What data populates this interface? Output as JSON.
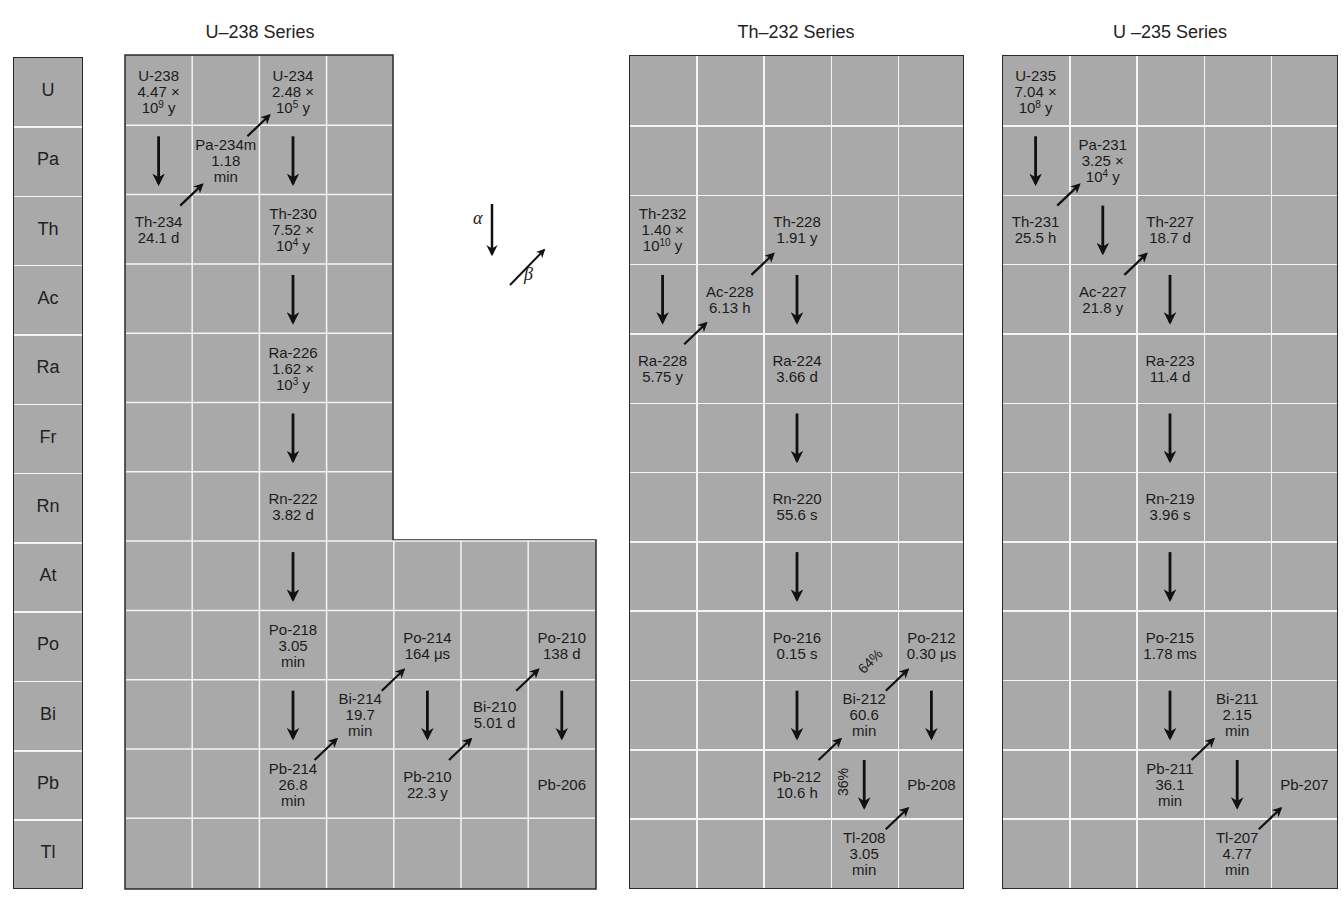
{
  "elements": [
    "U",
    "Pa",
    "Th",
    "Ac",
    "Ra",
    "Fr",
    "Rn",
    "At",
    "Po",
    "Bi",
    "Pb",
    "Tl"
  ],
  "legend": {
    "alpha_label": "α",
    "beta_label": "β"
  },
  "series": [
    {
      "id": "u238",
      "title": "U–238 Series",
      "nuclides": [
        {
          "name": "U-238",
          "halflife": [
            "4.47 ×",
            "10^9 y"
          ],
          "row": 0,
          "col": 0
        },
        {
          "name": "Pa-234m",
          "halflife": [
            "1.18",
            "min"
          ],
          "row": 1,
          "col": 1
        },
        {
          "name": "U-234",
          "halflife": [
            "2.48 ×",
            "10^5 y"
          ],
          "row": 0,
          "col": 2
        },
        {
          "name": "Th-234",
          "halflife": [
            "24.1 d"
          ],
          "row": 2,
          "col": 0
        },
        {
          "name": "Th-230",
          "halflife": [
            "7.52 ×",
            "10^4 y"
          ],
          "row": 2,
          "col": 2
        },
        {
          "name": "Ra-226",
          "halflife": [
            "1.62 ×",
            "10^3 y"
          ],
          "row": 4,
          "col": 2
        },
        {
          "name": "Rn-222",
          "halflife": [
            "3.82 d"
          ],
          "row": 6,
          "col": 2
        },
        {
          "name": "Po-218",
          "halflife": [
            "3.05",
            "min"
          ],
          "row": 8,
          "col": 2
        },
        {
          "name": "Pb-214",
          "halflife": [
            "26.8",
            "min"
          ],
          "row": 10,
          "col": 2
        },
        {
          "name": "Bi-214",
          "halflife": [
            "19.7",
            "min"
          ],
          "row": 9,
          "col": 3
        },
        {
          "name": "Po-214",
          "halflife": [
            "164 μs"
          ],
          "row": 8,
          "col": 4
        },
        {
          "name": "Pb-210",
          "halflife": [
            "22.3 y"
          ],
          "row": 10,
          "col": 4
        },
        {
          "name": "Bi-210",
          "halflife": [
            "5.01 d"
          ],
          "row": 9,
          "col": 5
        },
        {
          "name": "Po-210",
          "halflife": [
            "138 d"
          ],
          "row": 8,
          "col": 6
        },
        {
          "name": "Pb-206",
          "halflife": [],
          "row": 10,
          "col": 6
        }
      ],
      "decays": [
        {
          "type": "alpha",
          "from": "U-238",
          "to": "Th-234"
        },
        {
          "type": "beta",
          "from": "Th-234",
          "to": "Pa-234m"
        },
        {
          "type": "beta",
          "from": "Pa-234m",
          "to": "U-234"
        },
        {
          "type": "alpha",
          "from": "U-234",
          "to": "Th-230"
        },
        {
          "type": "alpha",
          "from": "Th-230",
          "to": "Ra-226"
        },
        {
          "type": "alpha",
          "from": "Ra-226",
          "to": "Rn-222"
        },
        {
          "type": "alpha",
          "from": "Rn-222",
          "to": "Po-218"
        },
        {
          "type": "alpha",
          "from": "Po-218",
          "to": "Pb-214"
        },
        {
          "type": "beta",
          "from": "Pb-214",
          "to": "Bi-214"
        },
        {
          "type": "beta",
          "from": "Bi-214",
          "to": "Po-214"
        },
        {
          "type": "alpha",
          "from": "Po-214",
          "to": "Pb-210"
        },
        {
          "type": "beta",
          "from": "Pb-210",
          "to": "Bi-210"
        },
        {
          "type": "beta",
          "from": "Bi-210",
          "to": "Po-210"
        },
        {
          "type": "alpha",
          "from": "Po-210",
          "to": "Pb-206"
        }
      ]
    },
    {
      "id": "th232",
      "title": "Th–232 Series",
      "nuclides": [
        {
          "name": "Th-232",
          "halflife": [
            "1.40 ×",
            "10^10 y"
          ],
          "row": 2,
          "col": 0
        },
        {
          "name": "Ra-228",
          "halflife": [
            "5.75 y"
          ],
          "row": 4,
          "col": 0
        },
        {
          "name": "Ac-228",
          "halflife": [
            "6.13 h"
          ],
          "row": 3,
          "col": 1
        },
        {
          "name": "Th-228",
          "halflife": [
            "1.91 y"
          ],
          "row": 2,
          "col": 2
        },
        {
          "name": "Ra-224",
          "halflife": [
            "3.66 d"
          ],
          "row": 4,
          "col": 2
        },
        {
          "name": "Rn-220",
          "halflife": [
            "55.6 s"
          ],
          "row": 6,
          "col": 2
        },
        {
          "name": "Po-216",
          "halflife": [
            "0.15 s"
          ],
          "row": 8,
          "col": 2
        },
        {
          "name": "Pb-212",
          "halflife": [
            "10.6 h"
          ],
          "row": 10,
          "col": 2
        },
        {
          "name": "Bi-212",
          "halflife": [
            "60.6",
            "min"
          ],
          "row": 9,
          "col": 3
        },
        {
          "name": "Po-212",
          "halflife": [
            "0.30 μs"
          ],
          "row": 8,
          "col": 4
        },
        {
          "name": "Tl-208",
          "halflife": [
            "3.05",
            "min"
          ],
          "row": 11,
          "col": 3
        },
        {
          "name": "Pb-208",
          "halflife": [],
          "row": 10,
          "col": 4
        }
      ],
      "decays": [
        {
          "type": "alpha",
          "from": "Th-232",
          "to": "Ra-228"
        },
        {
          "type": "beta",
          "from": "Ra-228",
          "to": "Ac-228"
        },
        {
          "type": "beta",
          "from": "Ac-228",
          "to": "Th-228"
        },
        {
          "type": "alpha",
          "from": "Th-228",
          "to": "Ra-224"
        },
        {
          "type": "alpha",
          "from": "Ra-224",
          "to": "Rn-220"
        },
        {
          "type": "alpha",
          "from": "Rn-220",
          "to": "Po-216"
        },
        {
          "type": "alpha",
          "from": "Po-216",
          "to": "Pb-212"
        },
        {
          "type": "beta",
          "from": "Pb-212",
          "to": "Bi-212"
        },
        {
          "type": "beta",
          "from": "Bi-212",
          "to": "Po-212",
          "branch": "64%"
        },
        {
          "type": "alpha",
          "from": "Bi-212",
          "to": "Tl-208",
          "branch": "36%"
        },
        {
          "type": "alpha",
          "from": "Po-212",
          "to": "Pb-208"
        },
        {
          "type": "beta",
          "from": "Tl-208",
          "to": "Pb-208"
        }
      ]
    },
    {
      "id": "u235",
      "title": "U –235 Series",
      "nuclides": [
        {
          "name": "U-235",
          "halflife": [
            "7.04 ×",
            "10^8 y"
          ],
          "row": 0,
          "col": 0
        },
        {
          "name": "Th-231",
          "halflife": [
            "25.5 h"
          ],
          "row": 2,
          "col": 0
        },
        {
          "name": "Pa-231",
          "halflife": [
            "3.25 ×",
            "10^4 y"
          ],
          "row": 1,
          "col": 1
        },
        {
          "name": "Ac-227",
          "halflife": [
            "21.8 y"
          ],
          "row": 3,
          "col": 1
        },
        {
          "name": "Th-227",
          "halflife": [
            "18.7 d"
          ],
          "row": 2,
          "col": 2
        },
        {
          "name": "Ra-223",
          "halflife": [
            "11.4 d"
          ],
          "row": 4,
          "col": 2
        },
        {
          "name": "Rn-219",
          "halflife": [
            "3.96 s"
          ],
          "row": 6,
          "col": 2
        },
        {
          "name": "Po-215",
          "halflife": [
            "1.78 ms"
          ],
          "row": 8,
          "col": 2
        },
        {
          "name": "Pb-211",
          "halflife": [
            "36.1",
            "min"
          ],
          "row": 10,
          "col": 2
        },
        {
          "name": "Bi-211",
          "halflife": [
            "2.15",
            "min"
          ],
          "row": 9,
          "col": 3
        },
        {
          "name": "Tl-207",
          "halflife": [
            "4.77",
            "min"
          ],
          "row": 11,
          "col": 3
        },
        {
          "name": "Pb-207",
          "halflife": [],
          "row": 10,
          "col": 4
        }
      ],
      "decays": [
        {
          "type": "alpha",
          "from": "U-235",
          "to": "Th-231"
        },
        {
          "type": "beta",
          "from": "Th-231",
          "to": "Pa-231"
        },
        {
          "type": "alpha",
          "from": "Pa-231",
          "to": "Ac-227"
        },
        {
          "type": "beta",
          "from": "Ac-227",
          "to": "Th-227"
        },
        {
          "type": "alpha",
          "from": "Th-227",
          "to": "Ra-223"
        },
        {
          "type": "alpha",
          "from": "Ra-223",
          "to": "Rn-219"
        },
        {
          "type": "alpha",
          "from": "Rn-219",
          "to": "Po-215"
        },
        {
          "type": "alpha",
          "from": "Po-215",
          "to": "Pb-211"
        },
        {
          "type": "beta",
          "from": "Pb-211",
          "to": "Bi-211"
        },
        {
          "type": "alpha",
          "from": "Bi-211",
          "to": "Tl-207"
        },
        {
          "type": "beta",
          "from": "Tl-207",
          "to": "Pb-207"
        }
      ]
    }
  ]
}
